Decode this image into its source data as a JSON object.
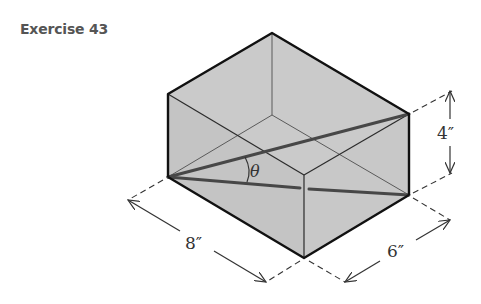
{
  "title": "Exercise 43",
  "figure": {
    "type": "rectangular-box",
    "colors": {
      "fill": "#c6c6c6",
      "edge": "#1a1a1a",
      "hidden_edge": "#555555",
      "diagonal": "#444444",
      "dimension": "#333333"
    },
    "dimensions": {
      "length_label": "8″",
      "width_label": "6″",
      "height_label": "4″"
    },
    "angle_label": "θ"
  }
}
